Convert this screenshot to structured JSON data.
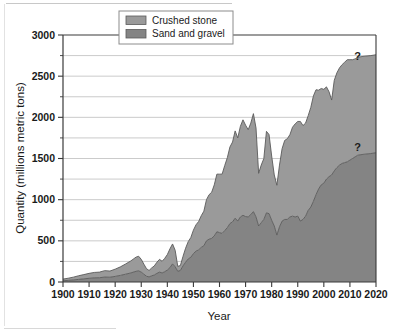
{
  "chart_data": {
    "type": "area",
    "title": "",
    "subtitle": "",
    "xlabel": "Year",
    "ylabel": "Quantity (millions metric tons)",
    "xlim": [
      1900,
      2020
    ],
    "ylim": [
      0,
      3000
    ],
    "stacked": true,
    "grid": true,
    "grid_interval": 250,
    "legend_position": "top-center",
    "xticks": [
      1900,
      1910,
      1920,
      1930,
      1940,
      1950,
      1960,
      1970,
      1980,
      1990,
      2000,
      2010,
      2020
    ],
    "xticklabels": [
      "1900",
      "1910",
      "1920",
      "1930",
      "1940",
      "1950",
      "1960",
      "1970",
      "1980",
      "1990",
      "2000",
      "2010",
      "2020"
    ],
    "yticks": [
      0,
      500,
      1000,
      1500,
      2000,
      2500,
      3000
    ],
    "yticklabels": [
      "0",
      "500",
      "1000",
      "1500",
      "2000",
      "2500",
      "3000"
    ],
    "y_minor_ticks": [
      250,
      750,
      1250,
      1750,
      2250,
      2750
    ],
    "colors": {
      "crushed_stone": "#9a9a9a",
      "sand_and_gravel": "#848484",
      "outline": "#5a5a5a",
      "gridline": "#b5b5b5",
      "axis": "#3a3a3a",
      "legend_border": "#8c8c8c",
      "legend_background": "#ffffff",
      "text": "#1a1a1a"
    },
    "annotations": [
      {
        "label": "?",
        "series": "Crushed stone",
        "x": 2013,
        "y": 2700
      },
      {
        "label": "?",
        "series": "Sand and gravel",
        "x": 2013,
        "y": 1590
      }
    ],
    "series": [
      {
        "name": "Sand and gravel",
        "color": "#848484",
        "x": [
          1900,
          1902,
          1904,
          1906,
          1908,
          1910,
          1912,
          1914,
          1916,
          1918,
          1920,
          1922,
          1924,
          1926,
          1928,
          1929,
          1930,
          1931,
          1932,
          1933,
          1934,
          1935,
          1936,
          1937,
          1938,
          1939,
          1940,
          1941,
          1942,
          1943,
          1944,
          1945,
          1946,
          1947,
          1948,
          1949,
          1950,
          1951,
          1952,
          1953,
          1954,
          1955,
          1956,
          1957,
          1958,
          1959,
          1960,
          1961,
          1962,
          1963,
          1964,
          1965,
          1966,
          1967,
          1968,
          1969,
          1970,
          1971,
          1972,
          1973,
          1974,
          1975,
          1976,
          1977,
          1978,
          1979,
          1980,
          1981,
          1982,
          1983,
          1984,
          1985,
          1986,
          1987,
          1988,
          1989,
          1990,
          1991,
          1992,
          1993,
          1994,
          1995,
          1996,
          1997,
          1998,
          1999,
          2000,
          2001,
          2002,
          2003,
          2004,
          2005,
          2006,
          2007,
          2008,
          2009,
          2010,
          2011,
          2012,
          2013,
          2015,
          2018,
          2020
        ],
        "values": [
          15,
          20,
          25,
          32,
          38,
          45,
          50,
          52,
          60,
          58,
          68,
          80,
          95,
          110,
          130,
          135,
          120,
          95,
          70,
          62,
          75,
          85,
          105,
          120,
          110,
          125,
          145,
          175,
          220,
          185,
          130,
          140,
          195,
          240,
          280,
          300,
          345,
          375,
          390,
          420,
          440,
          500,
          520,
          530,
          560,
          610,
          600,
          590,
          625,
          660,
          710,
          730,
          775,
          740,
          790,
          810,
          795,
          790,
          820,
          855,
          790,
          680,
          720,
          760,
          840,
          830,
          750,
          680,
          570,
          670,
          740,
          760,
          760,
          790,
          800,
          790,
          800,
          740,
          760,
          800,
          870,
          910,
          980,
          1060,
          1130,
          1180,
          1200,
          1250,
          1280,
          1300,
          1350,
          1390,
          1420,
          1440,
          1450,
          1460,
          1480,
          1500,
          1520,
          1540,
          1550,
          1560,
          1570
        ]
      },
      {
        "name": "Crushed stone",
        "color": "#9a9a9a",
        "x": [
          1900,
          1902,
          1904,
          1906,
          1908,
          1910,
          1912,
          1914,
          1916,
          1918,
          1920,
          1922,
          1924,
          1926,
          1928,
          1929,
          1930,
          1931,
          1932,
          1933,
          1934,
          1935,
          1936,
          1937,
          1938,
          1939,
          1940,
          1941,
          1942,
          1943,
          1944,
          1945,
          1946,
          1947,
          1948,
          1949,
          1950,
          1951,
          1952,
          1953,
          1954,
          1955,
          1956,
          1957,
          1958,
          1959,
          1960,
          1961,
          1962,
          1963,
          1964,
          1965,
          1966,
          1967,
          1968,
          1969,
          1970,
          1971,
          1972,
          1973,
          1974,
          1975,
          1976,
          1977,
          1978,
          1979,
          1980,
          1981,
          1982,
          1983,
          1984,
          1985,
          1986,
          1987,
          1988,
          1989,
          1990,
          1991,
          1992,
          1993,
          1994,
          1995,
          1996,
          1997,
          1998,
          1999,
          2000,
          2001,
          2002,
          2003,
          2004,
          2005,
          2006,
          2007,
          2008,
          2009,
          2010,
          2011,
          2012,
          2013,
          2015,
          2018,
          2020
        ],
        "values": [
          20,
          26,
          34,
          44,
          52,
          60,
          66,
          68,
          78,
          75,
          88,
          104,
          124,
          146,
          172,
          178,
          155,
          122,
          92,
          78,
          96,
          110,
          135,
          155,
          142,
          162,
          188,
          228,
          242,
          200,
          60,
          60,
          115,
          170,
          210,
          240,
          285,
          320,
          345,
          385,
          420,
          500,
          540,
          560,
          620,
          700,
          710,
          720,
          790,
          850,
          930,
          970,
          1060,
          1010,
          1100,
          1160,
          1110,
          1060,
          1110,
          1190,
          1080,
          640,
          700,
          740,
          990,
          960,
          780,
          620,
          605,
          750,
          880,
          960,
          980,
          1000,
          1080,
          1130,
          1150,
          1210,
          1140,
          1130,
          1150,
          1210,
          1280,
          1275,
          1200,
          1170,
          1140,
          1120,
          1030,
          910,
          1100,
          1150,
          1180,
          1200,
          1220,
          1240,
          1220,
          1200,
          1190,
          1190,
          1190,
          1190,
          1190
        ]
      }
    ],
    "totals_note": "Stacked: top boundary = crushed stone + sand and gravel"
  },
  "legend": {
    "items": [
      {
        "label": "Crushed stone",
        "color": "#9a9a9a"
      },
      {
        "label": "Sand and gravel",
        "color": "#848484"
      }
    ]
  },
  "axes": {
    "x_title": "Year",
    "y_title": "Quantity (millions metric tons)"
  }
}
